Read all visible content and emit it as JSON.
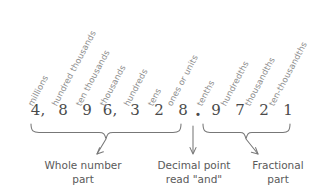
{
  "diagram": {
    "number_string": "4,896,328.9721",
    "colors": {
      "background": "#ffffff",
      "digit_text": "#4a4a4a",
      "label_text": "#8e8e8e",
      "caption_text": "#5a5a5a",
      "stroke": "#777777"
    }
  },
  "place_value_labels": [
    {
      "name": "millions",
      "text": "millions",
      "x": 34,
      "y": 99
    },
    {
      "name": "hundred-thousands",
      "text": "hundred thousands",
      "x": 58,
      "y": 99
    },
    {
      "name": "ten-thousands",
      "text": "ten thousands",
      "x": 82,
      "y": 99
    },
    {
      "name": "thousands",
      "text": "thousands",
      "x": 106,
      "y": 99
    },
    {
      "name": "hundreds",
      "text": "hundreds",
      "x": 130,
      "y": 99
    },
    {
      "name": "tens",
      "text": "tens",
      "x": 154,
      "y": 99
    },
    {
      "name": "ones-or-units",
      "text": "ones or units",
      "x": 173,
      "y": 99
    },
    {
      "name": "tenths",
      "text": "tenths",
      "x": 203,
      "y": 99
    },
    {
      "name": "hundredths",
      "text": "hundredths",
      "x": 227,
      "y": 99
    },
    {
      "name": "thousandths",
      "text": "thousandths",
      "x": 251,
      "y": 99
    },
    {
      "name": "ten-thousandths",
      "text": "ten-thousandths",
      "x": 275,
      "y": 99
    }
  ],
  "digits": [
    {
      "name": "digit-millions",
      "text": "4,",
      "x": 30,
      "place": "millions"
    },
    {
      "name": "digit-hundred-thousands",
      "text": "8",
      "x": 55,
      "place": "hundred thousands"
    },
    {
      "name": "digit-ten-thousands",
      "text": "9",
      "x": 79,
      "place": "ten thousands"
    },
    {
      "name": "digit-thousands",
      "text": "6,",
      "x": 102,
      "place": "thousands"
    },
    {
      "name": "digit-hundreds",
      "text": "3",
      "x": 127,
      "place": "hundreds"
    },
    {
      "name": "digit-tens",
      "text": "2",
      "x": 151,
      "place": "tens"
    },
    {
      "name": "digit-ones",
      "text": "8",
      "x": 175,
      "place": "ones or units"
    },
    {
      "name": "decimal-point",
      "text": ".",
      "x": 196,
      "place": "decimal point"
    },
    {
      "name": "digit-tenths",
      "text": "9",
      "x": 214,
      "place": "tenths"
    },
    {
      "name": "digit-hundredths",
      "text": "7",
      "x": 238,
      "place": "hundredths"
    },
    {
      "name": "digit-thousandths",
      "text": "2",
      "x": 262,
      "place": "thousandths"
    },
    {
      "name": "digit-ten-thousandths",
      "text": "1",
      "x": 286,
      "place": "ten-thousandths"
    }
  ],
  "captions": {
    "whole_number": {
      "line1": "Whole number",
      "line2": "part"
    },
    "decimal_point": {
      "line1": "Decimal point",
      "line2": "read \"and\""
    },
    "fractional": {
      "line1": "Fractional",
      "line2": "part"
    }
  }
}
